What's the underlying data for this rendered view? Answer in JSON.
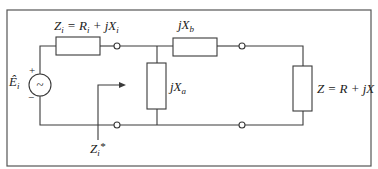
{
  "diagram": {
    "type": "circuit",
    "title": "",
    "colors": {
      "stroke": "#3a3a3a",
      "background": "#ffffff",
      "text": "#222222"
    },
    "source": {
      "label_main": "Ê",
      "label_sub": "i",
      "plus": "+",
      "minus": "−",
      "symbol": "~"
    },
    "components": {
      "source_impedance": {
        "label": "Z",
        "label_sub": "i",
        "eq": " = R",
        "eq_sub": "i",
        "tail": " + jX",
        "tail_sub": "i"
      },
      "shunt_reactance": {
        "label": "jX",
        "label_sub": "a"
      },
      "series_reactance": {
        "label": "jX",
        "label_sub": "b"
      },
      "load": {
        "label": "Z = R + jX"
      }
    },
    "annotation": {
      "label": "Z",
      "label_sub": "i",
      "suffix": "*"
    }
  }
}
